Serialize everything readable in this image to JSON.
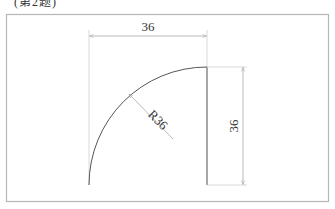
{
  "caption": "(第2题)",
  "diagram": {
    "type": "engineering-drawing",
    "colors": {
      "frame": "#b5b5b5",
      "geometry": "#555555",
      "dimension": "#aaaaaa",
      "text": "#333333"
    },
    "dimensions": {
      "horizontal": {
        "label": "36"
      },
      "vertical": {
        "label": "36"
      },
      "radius": {
        "label": "R36"
      }
    }
  }
}
